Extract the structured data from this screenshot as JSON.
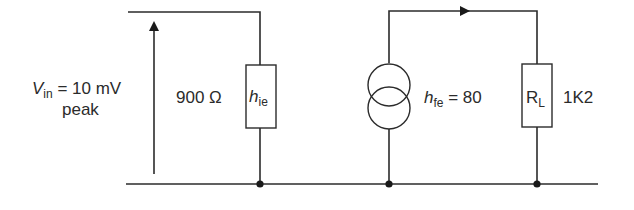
{
  "diagram": {
    "type": "small-signal transistor equivalent circuit",
    "input": {
      "symbol": "V",
      "subscript": "in",
      "value_text": " = 10 mV",
      "line2": "peak"
    },
    "hie": {
      "value": "900 Ω",
      "symbol": "h",
      "subscript": "ie"
    },
    "current_source": {
      "symbol": "h",
      "subscript": "fe",
      "value_text": " = 80"
    },
    "load": {
      "symbol": "R",
      "subscript": "L",
      "value": "1K2"
    },
    "colors": {
      "line": "#2b2b2b",
      "background": "#ffffff"
    }
  }
}
